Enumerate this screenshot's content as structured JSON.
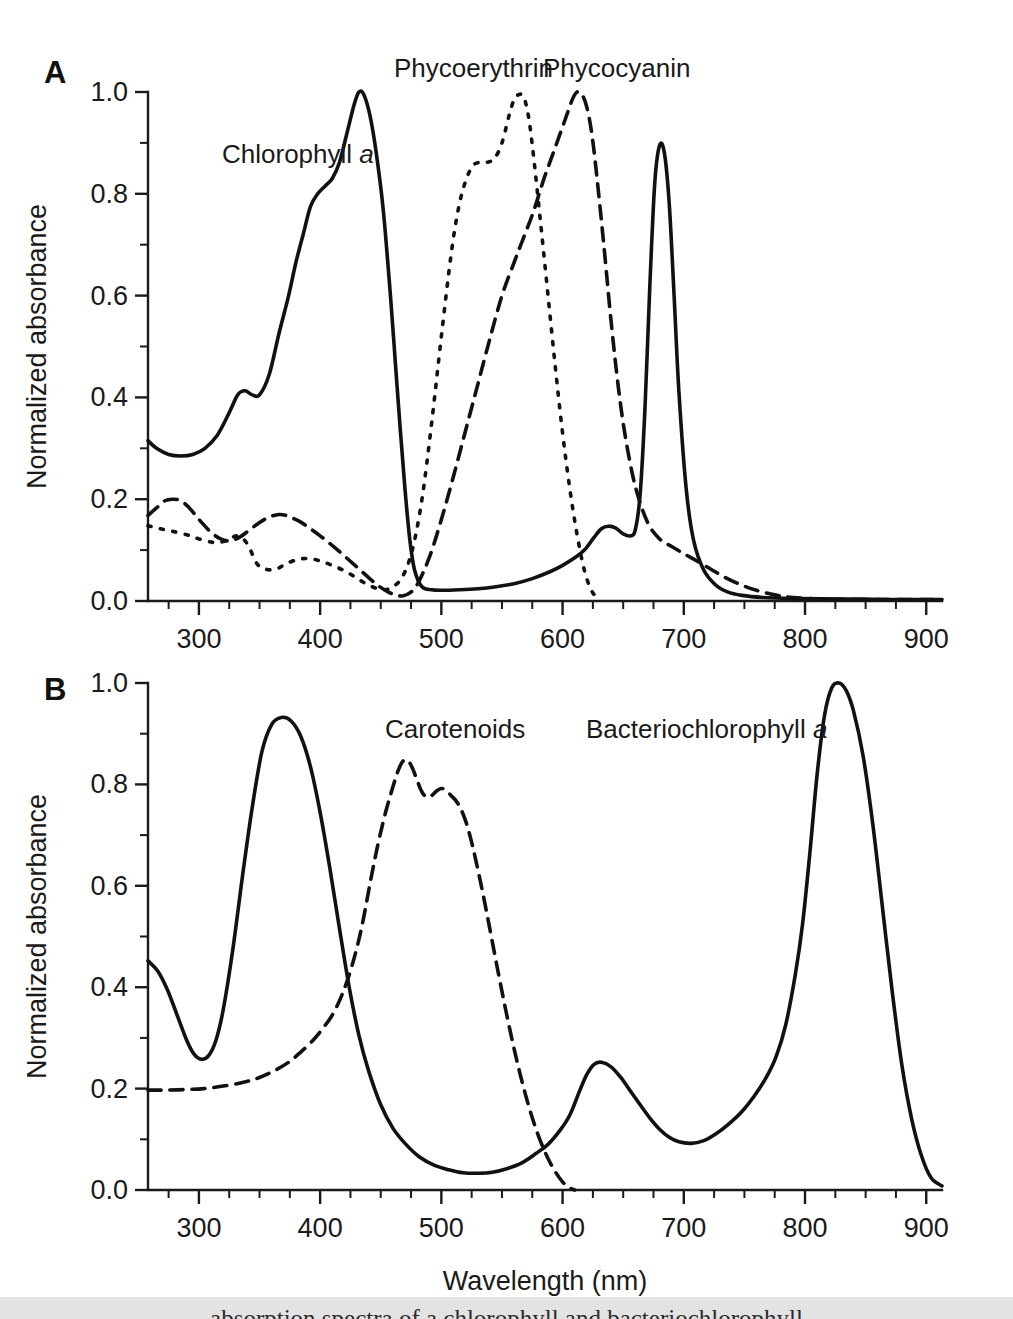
{
  "figure": {
    "background_color": "#ffffff",
    "ink_color": "#111111",
    "caption_bar_color": "#e3e3e3",
    "caption_text": "absorption spectra of  a  chlorophyll  and  bacteriochlorophyll"
  },
  "panels": [
    {
      "letter": "A",
      "ylabel": "Normalized absorbance",
      "xlabel": "",
      "yticks": [
        "0.0",
        "0.2",
        "0.4",
        "0.6",
        "0.8",
        "1.0"
      ],
      "xticks": [
        "300",
        "400",
        "500",
        "600",
        "700",
        "800",
        "900"
      ],
      "labels": [
        {
          "name": "chlorophyll-a",
          "text": "Chlorophyll ",
          "italic": "a",
          "x": 222,
          "y": 163
        },
        {
          "name": "phycoerythrin",
          "text": "Phycoerythrin",
          "italic": "",
          "x": 394,
          "y": 77
        },
        {
          "name": "phycocyanin",
          "text": "Phycocyanin",
          "italic": "",
          "x": 543,
          "y": 77
        }
      ]
    },
    {
      "letter": "B",
      "ylabel": "Normalized absorbance",
      "xlabel": "Wavelength (nm)",
      "yticks": [
        "0.0",
        "0.2",
        "0.4",
        "0.6",
        "0.8",
        "1.0"
      ],
      "xticks": [
        "300",
        "400",
        "500",
        "600",
        "700",
        "800",
        "900"
      ],
      "labels": [
        {
          "name": "carotenoids",
          "text": "Carotenoids",
          "italic": "",
          "x": 385,
          "y": 738
        },
        {
          "name": "bacteriochlorophyll-a",
          "text": "Bacteriochlorophyll ",
          "italic": "a",
          "x": 586,
          "y": 738
        }
      ]
    }
  ],
  "chart_data": [
    {
      "id": "panel-a",
      "type": "line",
      "title": "A",
      "xlabel": "Wavelength (nm)",
      "ylabel": "Normalized absorbance",
      "xlim": [
        258,
        913
      ],
      "ylim": [
        0.0,
        1.0
      ],
      "xticks": [
        300,
        400,
        500,
        600,
        700,
        800,
        900
      ],
      "xtick_minor_step": 25,
      "yticks": [
        0.0,
        0.2,
        0.4,
        0.6,
        0.8,
        1.0
      ],
      "ytick_minor_step": 0.1,
      "grid": false,
      "legend": "inline-annotations",
      "series": [
        {
          "name": "Chlorophyll a",
          "style": "solid",
          "x": [
            258,
            265,
            275,
            285,
            295,
            305,
            315,
            325,
            332,
            338,
            344,
            350,
            358,
            366,
            374,
            380,
            386,
            392,
            398,
            404,
            410,
            416,
            422,
            428,
            432,
            436,
            441,
            446,
            452,
            458,
            462,
            466,
            470,
            474,
            478,
            484,
            492,
            500,
            515,
            530,
            545,
            560,
            575,
            590,
            600,
            610,
            618,
            626,
            632,
            638,
            644,
            650,
            656,
            660,
            664,
            668,
            672,
            676,
            680,
            684,
            688,
            692,
            696,
            702,
            708,
            716,
            726,
            736,
            748,
            765,
            790,
            830,
            870,
            913
          ],
          "y": [
            0.315,
            0.3,
            0.288,
            0.285,
            0.288,
            0.3,
            0.325,
            0.37,
            0.405,
            0.413,
            0.405,
            0.405,
            0.445,
            0.525,
            0.6,
            0.665,
            0.72,
            0.775,
            0.8,
            0.815,
            0.83,
            0.862,
            0.918,
            0.975,
            1.0,
            0.995,
            0.955,
            0.885,
            0.77,
            0.6,
            0.47,
            0.34,
            0.22,
            0.12,
            0.06,
            0.028,
            0.022,
            0.021,
            0.022,
            0.024,
            0.028,
            0.034,
            0.044,
            0.058,
            0.07,
            0.085,
            0.1,
            0.125,
            0.142,
            0.147,
            0.143,
            0.132,
            0.128,
            0.14,
            0.21,
            0.38,
            0.62,
            0.82,
            0.895,
            0.88,
            0.78,
            0.6,
            0.41,
            0.22,
            0.12,
            0.063,
            0.032,
            0.018,
            0.011,
            0.007,
            0.005,
            0.004,
            0.003,
            0.003
          ]
        },
        {
          "name": "Phycoerythrin",
          "style": "dotted",
          "x": [
            258,
            268,
            278,
            290,
            300,
            312,
            322,
            332,
            340,
            348,
            356,
            364,
            372,
            382,
            392,
            402,
            412,
            422,
            432,
            442,
            452,
            460,
            468,
            476,
            484,
            492,
            500,
            508,
            514,
            520,
            526,
            532,
            538,
            544,
            550,
            556,
            560,
            564,
            568,
            572,
            576,
            582,
            588,
            594,
            600,
            606,
            612,
            618,
            624,
            630
          ],
          "y": [
            0.148,
            0.142,
            0.137,
            0.13,
            0.122,
            0.115,
            0.118,
            0.128,
            0.112,
            0.073,
            0.062,
            0.063,
            0.073,
            0.082,
            0.083,
            0.077,
            0.068,
            0.057,
            0.042,
            0.029,
            0.022,
            0.028,
            0.048,
            0.1,
            0.2,
            0.35,
            0.52,
            0.68,
            0.77,
            0.825,
            0.855,
            0.862,
            0.862,
            0.87,
            0.9,
            0.955,
            0.985,
            0.995,
            0.99,
            0.95,
            0.875,
            0.74,
            0.6,
            0.46,
            0.33,
            0.22,
            0.13,
            0.06,
            0.02,
            0.002
          ]
        },
        {
          "name": "Phycocyanin",
          "style": "dashed",
          "x": [
            258,
            266,
            272,
            278,
            284,
            290,
            296,
            302,
            310,
            318,
            326,
            334,
            342,
            350,
            358,
            366,
            372,
            378,
            384,
            392,
            400,
            408,
            416,
            424,
            432,
            440,
            448,
            456,
            462,
            468,
            474,
            480,
            490,
            500,
            510,
            520,
            530,
            540,
            550,
            560,
            568,
            576,
            584,
            590,
            596,
            602,
            608,
            612,
            616,
            620,
            624,
            628,
            634,
            640,
            646,
            652,
            660,
            670,
            680,
            690,
            700,
            712,
            724,
            736,
            748,
            760,
            775,
            790,
            810,
            840,
            875,
            913
          ],
          "y": [
            0.168,
            0.185,
            0.197,
            0.2,
            0.198,
            0.188,
            0.172,
            0.155,
            0.135,
            0.122,
            0.118,
            0.126,
            0.14,
            0.154,
            0.165,
            0.17,
            0.168,
            0.162,
            0.155,
            0.142,
            0.128,
            0.113,
            0.097,
            0.08,
            0.063,
            0.046,
            0.03,
            0.018,
            0.012,
            0.01,
            0.016,
            0.032,
            0.085,
            0.16,
            0.245,
            0.335,
            0.425,
            0.515,
            0.6,
            0.665,
            0.715,
            0.765,
            0.825,
            0.865,
            0.905,
            0.945,
            0.985,
            1.0,
            0.995,
            0.97,
            0.92,
            0.84,
            0.7,
            0.55,
            0.42,
            0.32,
            0.225,
            0.155,
            0.122,
            0.107,
            0.093,
            0.077,
            0.06,
            0.044,
            0.031,
            0.021,
            0.012,
            0.007,
            0.004,
            0.003,
            0.003,
            0.003
          ]
        }
      ]
    },
    {
      "id": "panel-b",
      "type": "line",
      "title": "B",
      "xlabel": "Wavelength (nm)",
      "ylabel": "Normalized absorbance",
      "xlim": [
        258,
        913
      ],
      "ylim": [
        0.0,
        1.0
      ],
      "xticks": [
        300,
        400,
        500,
        600,
        700,
        800,
        900
      ],
      "xtick_minor_step": 25,
      "yticks": [
        0.0,
        0.2,
        0.4,
        0.6,
        0.8,
        1.0
      ],
      "ytick_minor_step": 0.1,
      "grid": false,
      "legend": "inline-annotations",
      "series": [
        {
          "name": "Bacteriochlorophyll a",
          "style": "solid",
          "x": [
            258,
            266,
            274,
            282,
            290,
            296,
            302,
            308,
            314,
            320,
            328,
            336,
            344,
            352,
            360,
            368,
            376,
            384,
            392,
            400,
            408,
            416,
            424,
            432,
            440,
            450,
            460,
            470,
            482,
            494,
            506,
            518,
            530,
            542,
            554,
            566,
            578,
            588,
            598,
            606,
            614,
            620,
            626,
            632,
            640,
            648,
            656,
            664,
            672,
            680,
            688,
            696,
            706,
            716,
            726,
            736,
            748,
            758,
            768,
            776,
            784,
            792,
            798,
            804,
            810,
            816,
            822,
            828,
            834,
            840,
            848,
            856,
            864,
            872,
            880,
            888,
            896,
            904,
            913
          ],
          "y": [
            0.452,
            0.432,
            0.395,
            0.345,
            0.295,
            0.268,
            0.258,
            0.265,
            0.295,
            0.355,
            0.475,
            0.62,
            0.755,
            0.865,
            0.918,
            0.932,
            0.925,
            0.895,
            0.835,
            0.745,
            0.635,
            0.515,
            0.4,
            0.305,
            0.235,
            0.168,
            0.122,
            0.092,
            0.065,
            0.049,
            0.04,
            0.034,
            0.033,
            0.035,
            0.042,
            0.053,
            0.072,
            0.09,
            0.118,
            0.148,
            0.195,
            0.228,
            0.248,
            0.252,
            0.243,
            0.222,
            0.195,
            0.168,
            0.142,
            0.12,
            0.104,
            0.095,
            0.092,
            0.097,
            0.11,
            0.128,
            0.155,
            0.185,
            0.222,
            0.262,
            0.325,
            0.425,
            0.525,
            0.665,
            0.82,
            0.935,
            0.99,
            1.0,
            0.985,
            0.945,
            0.855,
            0.72,
            0.555,
            0.39,
            0.245,
            0.14,
            0.068,
            0.024,
            0.008
          ]
        },
        {
          "name": "Carotenoids",
          "style": "dashed",
          "x": [
            258,
            272,
            288,
            304,
            320,
            336,
            350,
            362,
            374,
            384,
            394,
            402,
            410,
            418,
            426,
            434,
            442,
            448,
            454,
            460,
            464,
            468,
            472,
            476,
            480,
            484,
            488,
            492,
            496,
            500,
            504,
            508,
            512,
            516,
            520,
            524,
            528,
            534,
            540,
            546,
            552,
            558,
            564,
            570,
            576,
            582,
            588,
            594,
            600,
            606,
            610
          ],
          "y": [
            0.197,
            0.197,
            0.198,
            0.2,
            0.205,
            0.212,
            0.222,
            0.235,
            0.252,
            0.272,
            0.295,
            0.318,
            0.345,
            0.385,
            0.44,
            0.515,
            0.615,
            0.685,
            0.745,
            0.795,
            0.825,
            0.845,
            0.848,
            0.833,
            0.808,
            0.785,
            0.775,
            0.778,
            0.787,
            0.792,
            0.788,
            0.778,
            0.768,
            0.752,
            0.728,
            0.695,
            0.655,
            0.588,
            0.515,
            0.44,
            0.368,
            0.3,
            0.238,
            0.183,
            0.135,
            0.095,
            0.062,
            0.036,
            0.016,
            0.004,
            0.0
          ]
        }
      ]
    }
  ]
}
